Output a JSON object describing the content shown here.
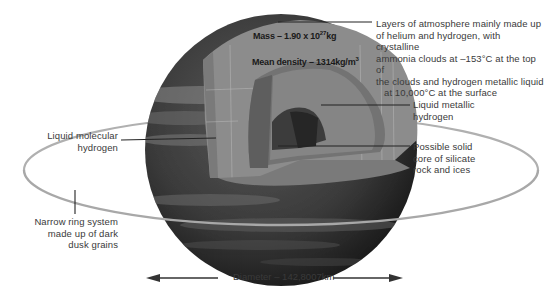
{
  "diagram": {
    "stats": {
      "mass_prefix": "Mass – 1.90 x 10",
      "mass_exp": "27",
      "mass_unit": "kg",
      "density_prefix": "Mean density – 1314kg/m",
      "density_exp": "3"
    },
    "labels": {
      "atmosphere": [
        "Layers of atmosphere mainly made up",
        "of helium and hydrogen, with crystalline",
        "ammonia clouds at –153°C at the top of",
        "the clouds and hydrogen metallic liquid",
        "at 10,000°C at the surface"
      ],
      "liquid_metallic": [
        "Liquid metallic",
        "hydrogen"
      ],
      "core": [
        "Possible solid",
        "core of silicate",
        "rock and ices"
      ],
      "liquid_molecular": [
        "Liquid molecular",
        "hydrogen"
      ],
      "ring": [
        "Narrow ring system",
        "made up of dark",
        "dusk grains"
      ]
    },
    "diameter": "Diameter – 142,8007km",
    "colors": {
      "planet_dark": "#1c1c1c",
      "planet_mid": "#4a4a4a",
      "layer_outer": "#8a8a8a",
      "layer_mid": "#707070",
      "core": "#3a3a3a",
      "ring": "#a8a8a8",
      "leader": "#222222",
      "text": "#3a3a3a"
    }
  }
}
